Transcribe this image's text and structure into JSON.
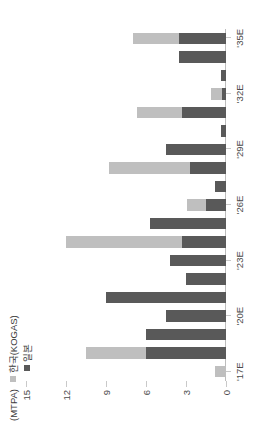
{
  "chart_data": {
    "type": "bar",
    "stacked": true,
    "title": "",
    "subtitle": "",
    "unit_label": "(MTPA)",
    "xlabel": "",
    "ylabel": "",
    "ylim": [
      0,
      15
    ],
    "yticks": [
      0,
      3,
      6,
      9,
      12,
      15
    ],
    "ytick_labels": [
      "0",
      "3",
      "6",
      "9",
      "12",
      "15"
    ],
    "grid": false,
    "legend_position": "top-left",
    "rotation_degrees": -90,
    "categories": [
      "'17E",
      "'18E",
      "'19E",
      "'20E",
      "'21E",
      "'22E",
      "'23E",
      "'24E",
      "'25E",
      "'26E",
      "'27E",
      "'28E",
      "'29E",
      "'30E",
      "'31E",
      "'32E",
      "'33E",
      "'34E",
      "'35E"
    ],
    "xtick_labels": [
      "'17E",
      "'20E",
      "'23E",
      "'26E",
      "'29E",
      "'32E",
      "'35E"
    ],
    "xtick_positions": [
      0,
      3,
      6,
      9,
      12,
      15,
      18
    ],
    "series": [
      {
        "name": "일본",
        "color": "#595959",
        "values": [
          0.0,
          6.0,
          6.0,
          4.5,
          9.0,
          3.0,
          4.2,
          3.3,
          5.7,
          1.5,
          0.8,
          2.7,
          4.5,
          0.4,
          3.3,
          0.3,
          0.4,
          3.5,
          3.5
        ]
      },
      {
        "name": "한국(KOGAS)",
        "color": "#bfbfbf",
        "values": [
          0.8,
          4.5,
          0.0,
          0.0,
          0.0,
          0.0,
          0.0,
          8.7,
          0.0,
          1.4,
          0.0,
          6.1,
          0.0,
          0.0,
          3.4,
          0.8,
          0.0,
          0.0,
          3.5
        ]
      }
    ]
  },
  "legend": {
    "unit": "(MTPA)",
    "items": [
      {
        "label": "한국(KOGAS)",
        "color": "#bfbfbf",
        "swatch": "square-swatch"
      },
      {
        "label": "일본",
        "color": "#595959",
        "swatch": "square-swatch"
      }
    ]
  },
  "colors": {
    "japan": "#595959",
    "korea": "#bfbfbf",
    "axis": "#c9c9c9",
    "text": "#4a4a4a",
    "background": "#ffffff"
  }
}
